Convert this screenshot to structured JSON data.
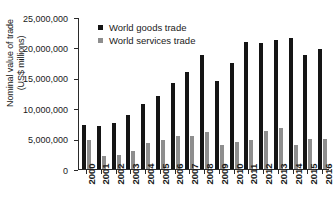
{
  "chart_data": {
    "type": "bar",
    "title": "",
    "xlabel": "",
    "ylabel": "Nominal value of trade (US$ millions)",
    "ylabel_line1": "Nominal value of trade",
    "ylabel_line2": "(US$ millions)",
    "ylim": [
      0,
      25000000
    ],
    "ytick_step": 5000000,
    "grid": false,
    "legend_position": "top-left inside plot",
    "xtick_rotation": 90,
    "categories": [
      "2000",
      "2001",
      "2002",
      "2003",
      "2004",
      "2005",
      "2006",
      "2007",
      "2008",
      "2009",
      "2010",
      "2011",
      "2012",
      "2013",
      "2014",
      "2015",
      "2016"
    ],
    "ytick_labels": [
      "0",
      "5,000,000",
      "10,000,000",
      "15,000,000",
      "20,000,000",
      "25,000,000"
    ],
    "ytick_values": [
      0,
      5000000,
      10000000,
      15000000,
      20000000,
      25000000
    ],
    "series": [
      {
        "name": "World goods trade",
        "color": "#151515",
        "values": [
          7200000,
          7000000,
          7600000,
          8900000,
          10700000,
          12000000,
          14100000,
          15900000,
          18700000,
          14400000,
          17400000,
          20900000,
          20700000,
          21300000,
          21500000,
          18800000,
          19700000
        ]
      },
      {
        "name": "World services trade",
        "color": "#8e8e8e",
        "values": [
          4700000,
          2100000,
          2300000,
          2900000,
          4300000,
          4800000,
          5400000,
          5500000,
          6100000,
          4000000,
          4400000,
          4700000,
          6300000,
          6800000,
          4000000,
          5000000,
          4900000
        ]
      }
    ]
  }
}
